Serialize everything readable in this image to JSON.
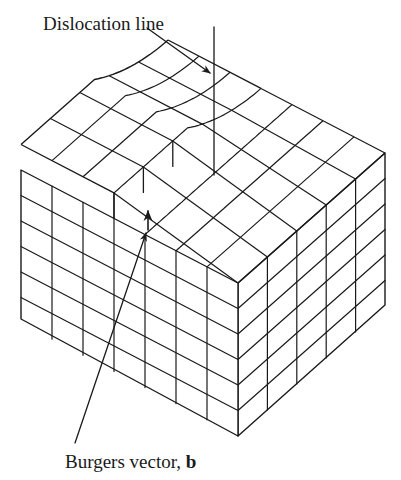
{
  "labels": {
    "dislocation_line": "Dislocation line",
    "burgers_vector_prefix": "Burgers vector, ",
    "burgers_vector_symbol": "b"
  },
  "colors": {
    "line": "#1a1a1a",
    "background": "#ffffff"
  },
  "diagram": {
    "front_corner": {
      "x": 238,
      "top": 283,
      "bottom": 436
    },
    "left_corner": {
      "x": 21,
      "top": 170,
      "bottom": 319
    },
    "right_corner": {
      "x": 385,
      "top": 153,
      "bottom": 305
    },
    "left_face": {
      "columns": 7,
      "rows": 6
    },
    "right_face": {
      "columns": 5,
      "rows": 6
    },
    "top_grid": {
      "columns": 7,
      "rows": 5
    },
    "dislocation_line": {
      "x": 214,
      "y_top": 27,
      "y_bottom": 175
    },
    "dislocation_pointer": {
      "from": [
        147,
        28
      ],
      "to": [
        210,
        73
      ]
    },
    "step": {
      "x": 148,
      "top": 205,
      "bottom": 232
    },
    "burgers_pointer": {
      "from": [
        75,
        443
      ],
      "to": [
        146,
        233
      ]
    }
  }
}
